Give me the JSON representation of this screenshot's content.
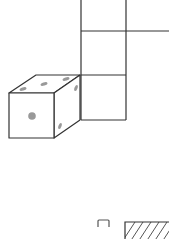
{
  "diagram": {
    "colors": {
      "background": "#ffffff",
      "stroke": "#333333",
      "pip": "#999999",
      "hatch": "#555555"
    },
    "net_squares": [
      {
        "id": "top",
        "x": 81,
        "y": -14,
        "w": 45,
        "h": 45
      },
      {
        "id": "middle",
        "x": 81,
        "y": 31,
        "w": 45,
        "h": 44
      },
      {
        "id": "bottom",
        "x": 81,
        "y": 75,
        "w": 45,
        "h": 45
      }
    ],
    "cube": {
      "front_face_pips": 1,
      "top_face_pips": 3,
      "right_face_pips": 2
    },
    "option_marks": [
      {
        "type": "bracket",
        "label": ""
      },
      {
        "type": "hatched-box",
        "label": ""
      }
    ]
  }
}
